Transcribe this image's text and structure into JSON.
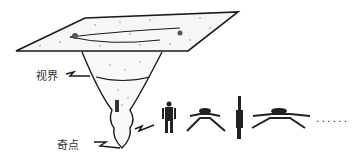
{
  "diagram": {
    "labels": {
      "horizon": "视界",
      "singularity": "奇点"
    },
    "ellipsis": "......",
    "colors": {
      "ink": "#1a1a1a",
      "text": "#333333",
      "background": "#ffffff"
    }
  }
}
